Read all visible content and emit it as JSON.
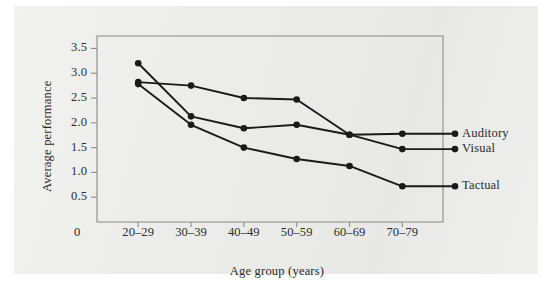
{
  "figure": {
    "background_color": "#ffffff",
    "panel_color": "#ececea",
    "frame_color": "#8a8a86",
    "ink_color": "#1a1a1a"
  },
  "chart_data": {
    "type": "line",
    "title": "",
    "xlabel": "Age group (years)",
    "ylabel": "Average performance",
    "categories": [
      "20–29",
      "30–39",
      "40–49",
      "50–59",
      "60–69",
      "70–79"
    ],
    "x_tick_labels": [
      "20–29",
      "30–39",
      "40–49",
      "50–59",
      "60–69",
      "70–79"
    ],
    "origin_label": "0",
    "y_tick_labels": [
      "3.5",
      "3.0",
      "2.5",
      "2.0",
      "1.5",
      "1.0",
      "0.5"
    ],
    "y_tick_values": [
      3.5,
      3.0,
      2.5,
      2.0,
      1.5,
      1.0,
      0.5
    ],
    "ylim": [
      0,
      3.75
    ],
    "grid": false,
    "legend_position": "right-inline-labels",
    "marker": "filled-circle",
    "series": [
      {
        "name": "Auditory",
        "label": "Auditory",
        "color": "#1a1a1a",
        "values": [
          2.82,
          2.75,
          2.5,
          2.47,
          1.76,
          1.78
        ],
        "label_value": 1.78
      },
      {
        "name": "Visual",
        "label": "Visual",
        "color": "#1a1a1a",
        "values": [
          3.2,
          2.13,
          1.89,
          1.96,
          1.76,
          1.47
        ],
        "label_value": 1.47
      },
      {
        "name": "Tactual",
        "label": "Tactual",
        "color": "#1a1a1a",
        "values": [
          2.78,
          1.96,
          1.5,
          1.27,
          1.13,
          0.72
        ],
        "label_value": 0.72
      }
    ]
  }
}
